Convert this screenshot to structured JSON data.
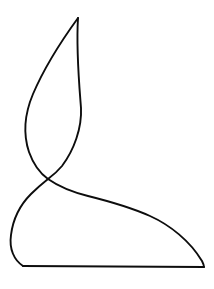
{
  "figure": {
    "domain": "Natural-Image",
    "canvas": {
      "width": 214,
      "height": 289,
      "background_color": "#ffffff"
    },
    "style": {
      "stroke_color": "#0d0d0d",
      "stroke_width": 1.9,
      "fill": "none",
      "line_cap": "round",
      "line_join": "round"
    },
    "key_points": {
      "apex": [
        78,
        18
      ],
      "leaf_left_extreme": [
        24,
        115
      ],
      "leaf_right_extreme": [
        81,
        110
      ],
      "crossing_point": [
        48,
        179
      ],
      "base_left_extreme": [
        11,
        241
      ],
      "bottom_edge_y": 267,
      "right_tip": [
        204,
        267
      ],
      "sweep_midpoint": [
        120,
        212
      ]
    },
    "paths": [
      {
        "name": "leaf-blade-outline",
        "role": "pointed leaf or flame form, upper portion",
        "d": "M 78 18 C 76 50 79 82 81 108 C 82 128 74 150 62 166 C 57 172 52 176 48 179 C 43 183 37 188 31 194 C 21 204 13 219 11 235 C 9 249 14 260 23 266"
      },
      {
        "name": "leaf-left-edge",
        "role": "left concave edge of leaf sweeping from apex down through the crossing",
        "d": "M 78 18 C 62 40 45 66 33 94 C 25 113 23 134 29 152 C 34 166 41 174 48 179 C 58 186 72 192 88 196 C 108 201 130 207 150 216 C 170 225 190 241 202 261 C 203 263 204 265 204 267"
      },
      {
        "name": "base-bottom-edge",
        "role": "flat bottom edge of the base form",
        "d": "M 23 266 L 204 267"
      }
    ]
  }
}
